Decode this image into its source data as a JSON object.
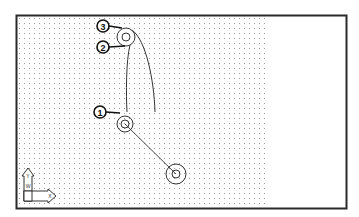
{
  "drawing": {
    "frame": {
      "x": 16,
      "y": 15,
      "width": 331,
      "height": 194,
      "stroke": "#2a2a2a"
    },
    "grid": {
      "x": 19,
      "y": 18,
      "width": 250,
      "height": 188,
      "spacing": 5,
      "dot_color": "#9a9a9a"
    },
    "circles": [
      {
        "id": "top",
        "cx": 126,
        "cy": 37,
        "r_outer": 9,
        "r_inner": 4
      },
      {
        "id": "middle",
        "cx": 125,
        "cy": 124,
        "r_outer": 8,
        "r_inner": 4
      },
      {
        "id": "bottom",
        "cx": 176,
        "cy": 174,
        "r_outer": 10,
        "r_inner": 4
      }
    ],
    "callouts": [
      {
        "label": "3",
        "cx": 103,
        "cy": 26,
        "leader_to_x": 122,
        "leader_to_y": 28
      },
      {
        "label": "2",
        "cx": 103,
        "cy": 47,
        "leader_to_x": 125,
        "leader_to_y": 46
      },
      {
        "label": "1",
        "cx": 100,
        "cy": 112,
        "leader_to_x": 120,
        "leader_to_y": 114
      }
    ],
    "ucs_icon": {
      "x": 22,
      "y": 165,
      "axis_x_label": "X",
      "axis_y_label": "Y",
      "w_label": "W"
    }
  }
}
